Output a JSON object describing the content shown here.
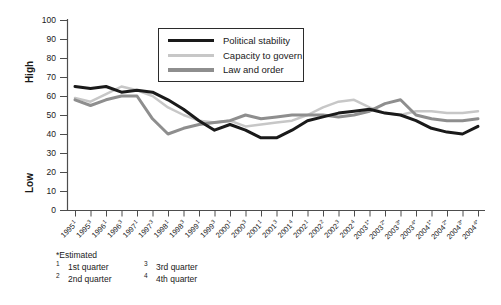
{
  "chart_data": {
    "type": "line",
    "title": "",
    "xlabel": "",
    "ylabel": "",
    "ylim": [
      0,
      100
    ],
    "yticks": [
      0,
      10,
      20,
      30,
      40,
      50,
      60,
      70,
      80,
      90,
      100
    ],
    "grid": false,
    "legend_position": "top-center-inside",
    "categories": [
      "1995¹",
      "1995³",
      "1996¹",
      "1996³",
      "1997¹",
      "1997³",
      "1998¹",
      "1998³",
      "1999¹",
      "1999³",
      "2000¹",
      "2000³",
      "2001¹",
      "2001³",
      "2001⁴",
      "2002¹",
      "2002²",
      "2002³",
      "2002⁴",
      "2003¹*",
      "2003²*",
      "2003³*",
      "2003⁴*",
      "2004¹*",
      "2004²*",
      "2004³*",
      "2004⁴*"
    ],
    "series": [
      {
        "name": "Political stability",
        "color": "#1a1a1a",
        "stroke_width": 3,
        "values": [
          65,
          64,
          65,
          62,
          63,
          62,
          58,
          53,
          47,
          42,
          45,
          42,
          38,
          38,
          42,
          47,
          49,
          51,
          52,
          53,
          51,
          50,
          47,
          43,
          41,
          40,
          44
        ]
      },
      {
        "name": "Capacity to govern",
        "color": "#c7c7c7",
        "stroke_width": 2.5,
        "values": [
          59,
          57,
          61,
          65,
          63,
          60,
          54,
          50,
          47,
          46,
          47,
          44,
          45,
          46,
          47,
          50,
          54,
          57,
          58,
          54,
          51,
          50,
          52,
          52,
          51,
          51,
          52
        ]
      },
      {
        "name": "Law and order",
        "color": "#8e8e8e",
        "stroke_width": 3,
        "values": [
          58,
          55,
          58,
          60,
          60,
          48,
          40,
          43,
          45,
          46,
          47,
          50,
          48,
          49,
          50,
          50,
          50,
          49,
          50,
          52,
          56,
          58,
          50,
          48,
          47,
          47,
          48
        ]
      }
    ]
  },
  "y_axis": {
    "high_label": "High",
    "low_label": "Low"
  },
  "footnotes": {
    "estimated": "*Estimated",
    "items": [
      {
        "sup": "1",
        "text": "1st quarter"
      },
      {
        "sup": "2",
        "text": "2nd quarter"
      },
      {
        "sup": "3",
        "text": "3rd quarter"
      },
      {
        "sup": "4",
        "text": "4th quarter"
      }
    ]
  }
}
